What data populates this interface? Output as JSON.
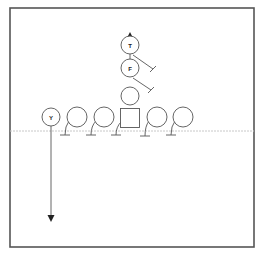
{
  "diagram": {
    "type": "football-play",
    "frame": {
      "x": 10,
      "y": 8,
      "width": 244,
      "height": 239
    },
    "line_of_scrimmage_y": 131,
    "colors": {
      "stroke": "#555555",
      "line_of_scrimmage": "#c8c8c8",
      "arrow": "#222222"
    },
    "players": [
      {
        "id": "Y",
        "label": "Y",
        "shape": "circle",
        "cx": 51,
        "cy": 117,
        "r": 9
      },
      {
        "id": "LT",
        "label": "",
        "shape": "circle",
        "cx": 77,
        "cy": 117,
        "r": 10
      },
      {
        "id": "LG",
        "label": "",
        "shape": "circle",
        "cx": 104,
        "cy": 117,
        "r": 10
      },
      {
        "id": "C",
        "label": "",
        "shape": "square",
        "cx": 130,
        "cy": 118,
        "size": 19
      },
      {
        "id": "RG",
        "label": "",
        "shape": "circle",
        "cx": 157,
        "cy": 117,
        "r": 10
      },
      {
        "id": "RT",
        "label": "",
        "shape": "circle",
        "cx": 183,
        "cy": 117,
        "r": 10
      },
      {
        "id": "QB",
        "label": "",
        "shape": "circle",
        "cx": 130,
        "cy": 96,
        "r": 9
      },
      {
        "id": "F",
        "label": "F",
        "shape": "circle",
        "cx": 130,
        "cy": 68,
        "r": 9
      },
      {
        "id": "T",
        "label": "T",
        "shape": "circle",
        "cx": 130,
        "cy": 45,
        "r": 9
      }
    ],
    "routes": [
      {
        "from": "Y",
        "type": "arrow",
        "path": "M51 126 L51 220",
        "arrow": "down",
        "tip": [
          51,
          222
        ]
      },
      {
        "from": "T",
        "type": "arrow",
        "path": "M130 77 L130 34",
        "arrow": "up",
        "tip": [
          130,
          32
        ]
      },
      {
        "from": "T",
        "type": "block",
        "path": "M133 55 L153 69",
        "bar": [
          150,
          72,
          156,
          66
        ]
      },
      {
        "from": "F",
        "type": "block",
        "path": "M133 78 L151 90",
        "bar": [
          148,
          93,
          154,
          87
        ]
      },
      {
        "from": "LT",
        "type": "block",
        "path": "M69 121 Q65 126 65 135",
        "bar": [
          60,
          135,
          70,
          135
        ]
      },
      {
        "from": "LG",
        "type": "block",
        "path": "M96 121 Q91 126 91 135",
        "bar": [
          86,
          135,
          96,
          135
        ]
      },
      {
        "from": "C",
        "type": "block",
        "path": "M121 122 Q116 127 116 135",
        "bar": [
          111,
          135,
          121,
          135
        ]
      },
      {
        "from": "RG",
        "type": "block",
        "path": "M149 121 Q145 126 145 136",
        "bar": [
          140,
          136,
          150,
          136
        ]
      },
      {
        "from": "RT",
        "type": "block",
        "path": "M175 121 Q171 126 171 135",
        "bar": [
          166,
          135,
          176,
          135
        ]
      }
    ]
  }
}
